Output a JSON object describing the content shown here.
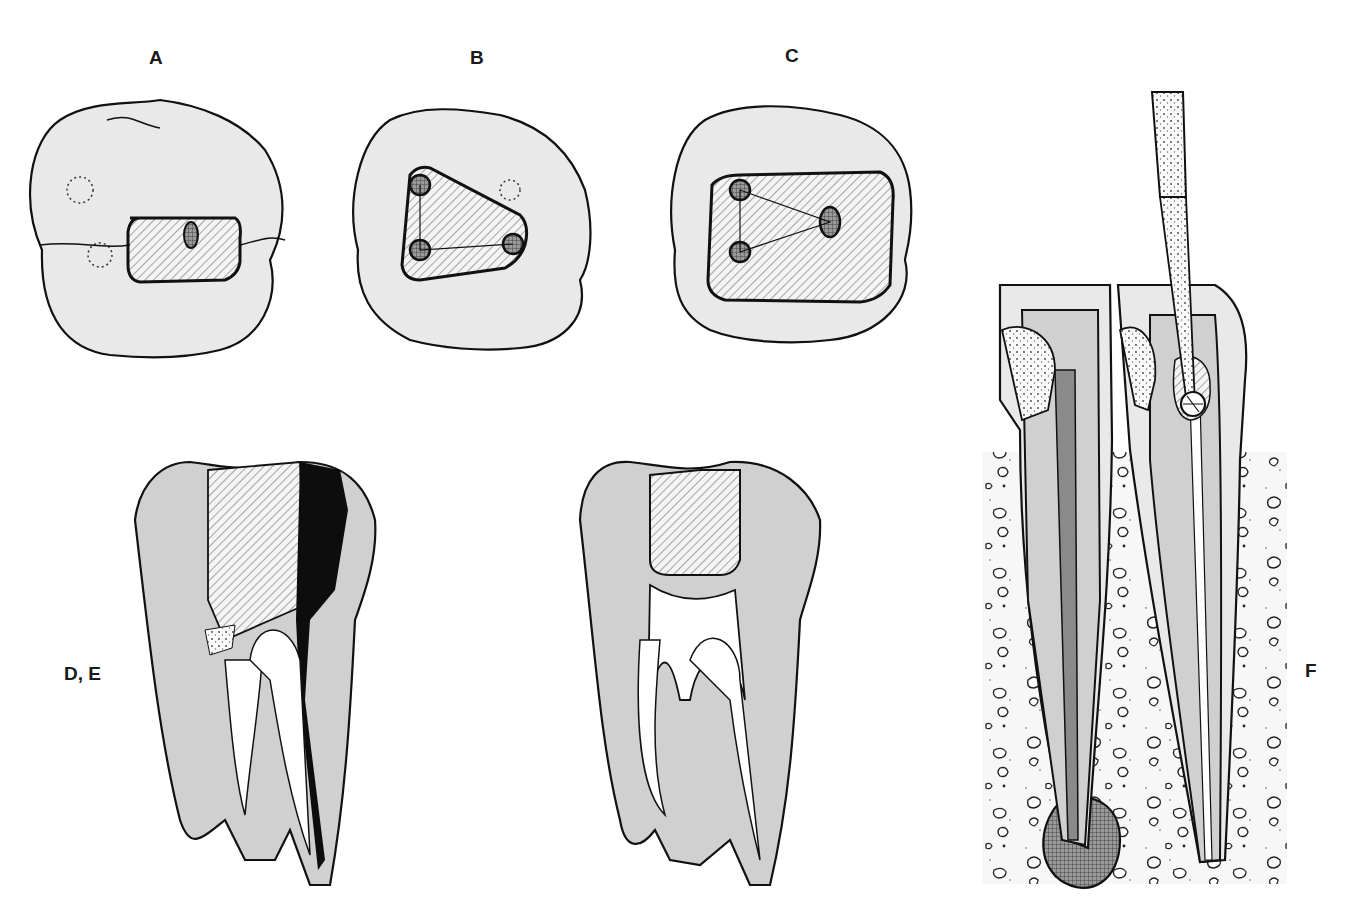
{
  "figure": {
    "labels": {
      "a": "A",
      "b": "B",
      "c": "C",
      "de": "D, E",
      "f": "F"
    },
    "panels": [
      {
        "id": "A",
        "view": "occlusal",
        "description": "Occlusal view of molar with small access cavity showing single oval canal orifice; dotted circles indicate missed canal locations"
      },
      {
        "id": "B",
        "view": "occlusal",
        "description": "Occlusal view with triangular access outline showing three canal orifices; dotted circle indicates additional canal"
      },
      {
        "id": "C",
        "view": "occlusal",
        "description": "Occlusal view with enlarged rectangular access outline showing four canal orifices connected by lines"
      },
      {
        "id": "D",
        "view": "cross-section",
        "description": "Sectioned molar with restoration (hatched), caries/perforation (black) and debris (stippled) at canal orifice"
      },
      {
        "id": "E",
        "view": "cross-section",
        "description": "Sectioned molar with hatched restoration and open pulp chamber and canals"
      },
      {
        "id": "F",
        "view": "cross-section",
        "description": "Two teeth in bone (stippled with trabecular pattern); left tooth with obturated canal and periapical lesion (cross-hatched); right tooth with instrument (bur) entering pulp chamber"
      }
    ],
    "colors": {
      "enamel": "#e8e8e8",
      "dentin": "#cfcfcf",
      "outline": "#111111",
      "filling_dark": "#8a8a8a",
      "caries": "#0d0d0d",
      "lesion": "#6a6a6a",
      "background": "#ffffff"
    }
  }
}
